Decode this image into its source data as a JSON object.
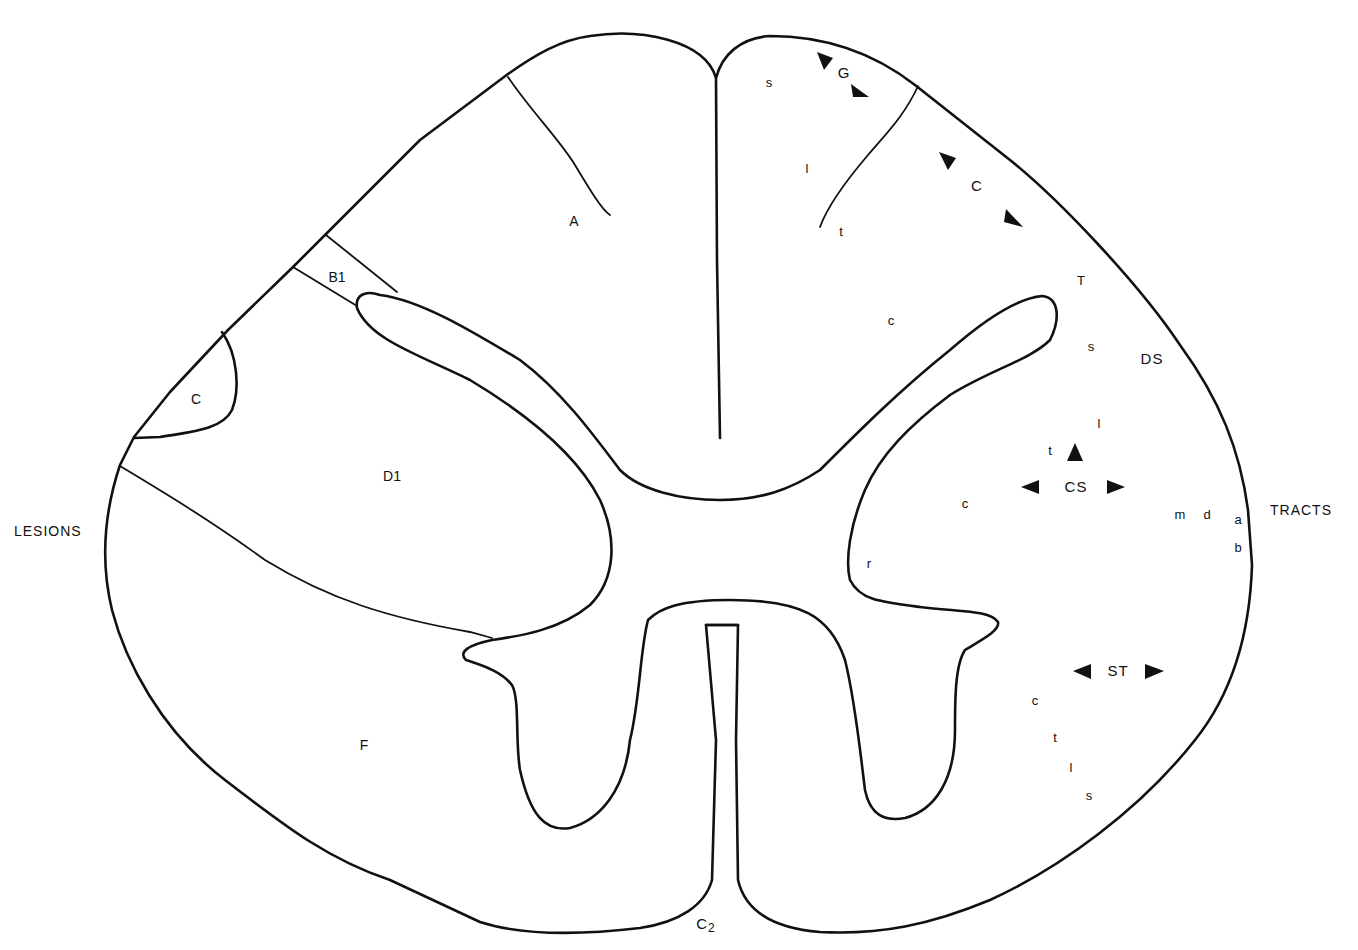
{
  "diagram": {
    "side_labels": {
      "left": "LESIONS",
      "right": "TRACTS",
      "bottom": "C",
      "bottom_subscript": "2"
    },
    "lesion_labels": {
      "A": "A",
      "B1": "B1",
      "C": "C",
      "D1": "D1",
      "F": "F"
    },
    "tract_labels": {
      "gracile": {
        "name": "G",
        "s": "s",
        "l": "l",
        "t": "t"
      },
      "cuneate": {
        "name": "C",
        "c": "c"
      },
      "dorsal_spinocerebellar": {
        "name": "DS",
        "T": "T",
        "s": "s",
        "l": "l",
        "t": "t"
      },
      "corticospinal": {
        "name": "CS",
        "c": "c",
        "r": "r"
      },
      "ventral_letters": {
        "m": "m",
        "d": "d",
        "a": "a",
        "b": "b"
      },
      "spinothalamic": {
        "name": "ST",
        "c": "c",
        "t": "t",
        "l": "l",
        "s": "s"
      }
    },
    "arrow_markers": [
      {
        "name": "gracile-arrow-upper-left",
        "direction": "up-left"
      },
      {
        "name": "gracile-arrow-lower-right",
        "direction": "down-right"
      },
      {
        "name": "cuneate-arrow-upper-left",
        "direction": "up-left"
      },
      {
        "name": "cuneate-arrow-lower-right",
        "direction": "down-right"
      },
      {
        "name": "cs-arrow-up",
        "direction": "up"
      },
      {
        "name": "cs-arrow-left",
        "direction": "left"
      },
      {
        "name": "cs-arrow-right",
        "direction": "right"
      },
      {
        "name": "st-arrow-left",
        "direction": "left"
      },
      {
        "name": "st-arrow-right",
        "direction": "right"
      }
    ],
    "colors": {
      "ink": "#111111",
      "background": "#ffffff"
    }
  }
}
